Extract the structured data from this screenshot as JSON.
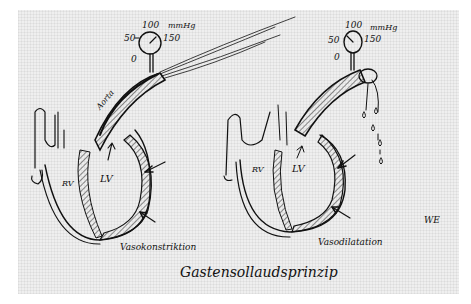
{
  "diagram": {
    "type": "hand-drawn sketch",
    "caption": "Gastensollaudsprinzip",
    "signature": "WE",
    "panels": [
      {
        "name": "left",
        "label": "Vasokonstriktion",
        "vessel_label": "Aorta",
        "chambers": [
          "RV",
          "LV"
        ],
        "gauge": {
          "ticks": [
            "0",
            "50",
            "100",
            "150"
          ],
          "unit": "mmHg"
        },
        "outflow": "jet"
      },
      {
        "name": "right",
        "label": "Vasodilatation",
        "chambers": [
          "RV",
          "LV"
        ],
        "gauge": {
          "ticks": [
            "0",
            "50",
            "100",
            "150"
          ],
          "unit": "mmHg"
        },
        "outflow": "drips"
      }
    ]
  }
}
